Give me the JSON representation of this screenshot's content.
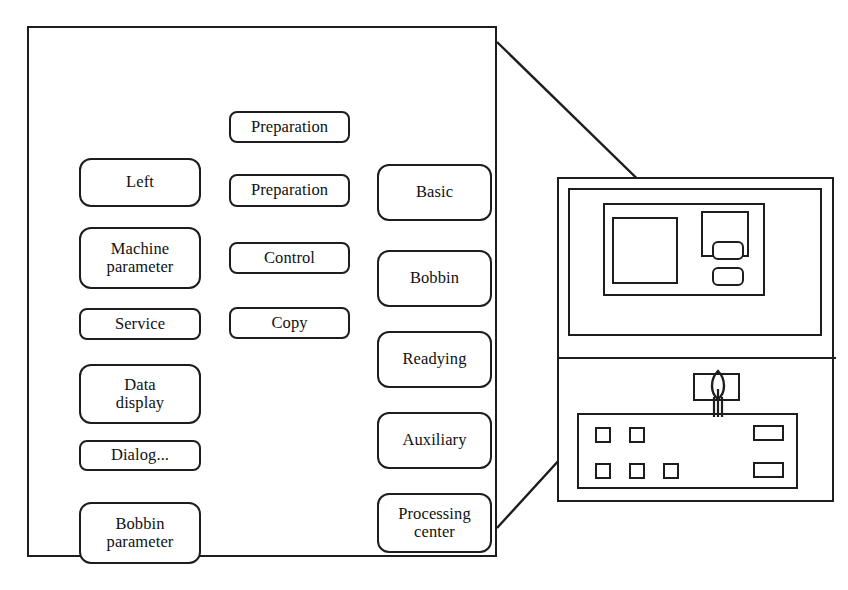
{
  "diagram": {
    "stroke_color": "#1d1d1d",
    "background_color": "#ffffff"
  },
  "menu_panel": {
    "name": "menu-panel",
    "columns": {
      "left": {
        "buttons": [
          {
            "id": "left",
            "label": "Left"
          },
          {
            "id": "machine-param",
            "label": "Machine\nparameter"
          },
          {
            "id": "service",
            "label": "Service"
          },
          {
            "id": "data-display",
            "label": "Data\ndisplay"
          },
          {
            "id": "dialog",
            "label": "Dialog..."
          },
          {
            "id": "bobbin-param",
            "label": "Bobbin\nparameter"
          }
        ]
      },
      "middle": {
        "buttons": [
          {
            "id": "preparation-1",
            "label": "Preparation"
          },
          {
            "id": "preparation-2",
            "label": "Preparation"
          },
          {
            "id": "control",
            "label": "Control"
          },
          {
            "id": "copy",
            "label": "Copy"
          }
        ]
      },
      "right": {
        "buttons": [
          {
            "id": "basic",
            "label": "Basic"
          },
          {
            "id": "bobbin",
            "label": "Bobbin"
          },
          {
            "id": "readying",
            "label": "Readying"
          },
          {
            "id": "auxiliary",
            "label": "Auxiliary"
          },
          {
            "id": "processing-center",
            "label": "Processing\ncenter"
          }
        ]
      }
    }
  },
  "machine": {
    "name": "machine-terminal",
    "upper": {
      "name": "display-housing",
      "screen": {
        "name": "screen-area"
      },
      "display": {
        "name": "display-viewport"
      },
      "softkey_panel": {
        "name": "softkey-panel"
      },
      "softkeys": [
        {
          "id": "softkey-1"
        },
        {
          "id": "softkey-2"
        }
      ]
    },
    "lower": {
      "name": "keypad-housing",
      "keys_row_top": [
        {
          "id": "key-1"
        },
        {
          "id": "key-2"
        }
      ],
      "keys_row_bottom": [
        {
          "id": "key-3"
        },
        {
          "id": "key-4"
        },
        {
          "id": "key-5"
        }
      ],
      "wide_keys": [
        {
          "id": "wide-key-1"
        },
        {
          "id": "wide-key-2"
        }
      ],
      "spindle_indicator": {
        "name": "spindle-icon"
      }
    }
  },
  "callout": {
    "name": "callout-lines",
    "description": "Lines connecting the enlarged menu panel to the machine display viewport"
  }
}
